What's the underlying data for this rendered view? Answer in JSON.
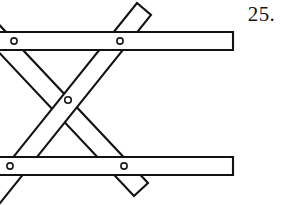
{
  "figure": {
    "label": "25.",
    "caption_number": "25",
    "kind": "scissor-linkage-diagram",
    "canvas": {
      "width": 281,
      "height": 205,
      "background": "#ffffff"
    },
    "colors": {
      "outline": "#121212",
      "fill": "#ffffff",
      "rivet_outline": "#1a1a1a",
      "label_text": "#141414"
    },
    "bars": [
      {
        "name": "top-horizontal-bar",
        "orientation": "horizontal",
        "points": "-20,32 233,32 233,50 -20,50",
        "thickness": 18
      },
      {
        "name": "bottom-horizontal-bar",
        "orientation": "horizontal",
        "points": "-20,157 233,157 233,175 -20,175",
        "thickness": 18
      },
      {
        "name": "diagonal-bar-rising",
        "orientation": "diagonal-up-right",
        "points": "-26,206 137,3 151,15 -12,218",
        "thickness": 17
      },
      {
        "name": "diagonal-bar-falling",
        "orientation": "diagonal-down-right",
        "points": "-26,-2 148,183 134,196 -40,11",
        "thickness": 17
      }
    ],
    "rivets": [
      {
        "name": "rivet-top-left",
        "cx": 14,
        "cy": 41,
        "r": 3.1
      },
      {
        "name": "rivet-top-right",
        "cx": 120,
        "cy": 41,
        "r": 3.1
      },
      {
        "name": "rivet-center-pivot",
        "cx": 68,
        "cy": 100,
        "r": 3.3
      },
      {
        "name": "rivet-bottom-left",
        "cx": 10,
        "cy": 166,
        "r": 3.1
      },
      {
        "name": "rivet-bottom-right",
        "cx": 124,
        "cy": 166,
        "r": 3.1
      }
    ]
  }
}
